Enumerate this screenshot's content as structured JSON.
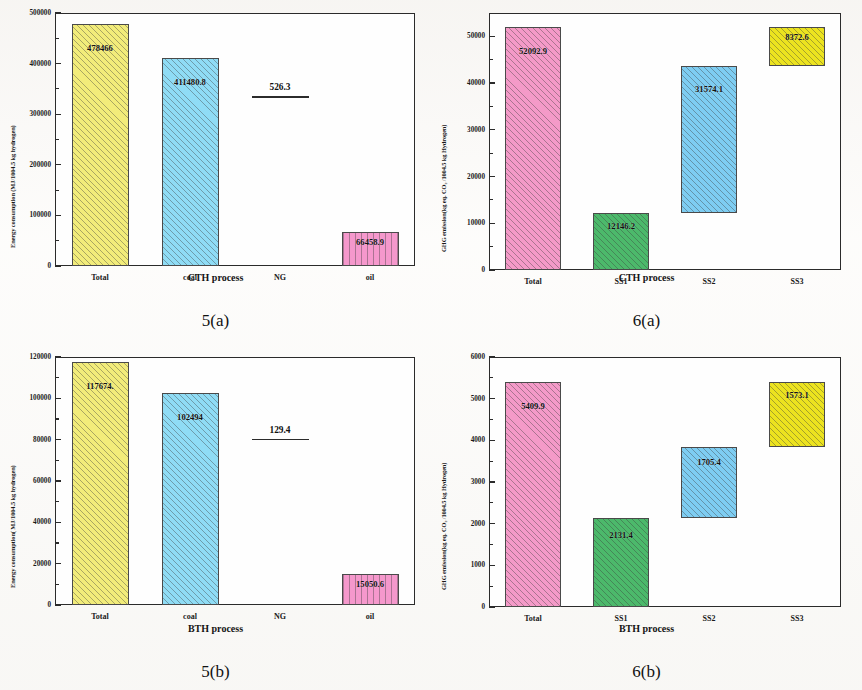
{
  "figure": {
    "panels": [
      "5(a)",
      "5(b)",
      "6(a)",
      "6(b)"
    ]
  },
  "panel_5a": {
    "caption": "5(a)",
    "xlabel": "CTH process",
    "ylabel": "Energy consumption (MJ/1004.5 kg hydrogen)",
    "yticks": [
      "0",
      "100000",
      "200000",
      "300000",
      "400000",
      "500000"
    ],
    "xticks": [
      "Total",
      "coal",
      "NG",
      "oil"
    ],
    "labels": [
      "478466",
      "411480.8",
      "526.3",
      "66458.9"
    ]
  },
  "panel_5b": {
    "caption": "5(b)",
    "xlabel": "BTH process",
    "ylabel": "Energy consumption( MJ/1004.5 kg hydrogen)",
    "yticks": [
      "0",
      "20000",
      "40000",
      "60000",
      "80000",
      "100000",
      "120000"
    ],
    "xticks": [
      "Total",
      "coal",
      "NG",
      "oil"
    ],
    "labels": [
      "117674.",
      "102494",
      "129.4",
      "15050.6"
    ]
  },
  "panel_6a": {
    "caption": "6(a)",
    "xlabel": "CTH process",
    "ylabel": "GHG emission(kg eq. CO₂ /1004.5 kg Hydrogen)",
    "yticks": [
      "0",
      "10000",
      "20000",
      "30000",
      "40000",
      "50000"
    ],
    "xticks": [
      "Total",
      "SS1",
      "SS2",
      "SS3"
    ],
    "labels": [
      "52092.9",
      "12146.2",
      "31574.1",
      "8372.6"
    ]
  },
  "panel_6b": {
    "caption": "6(b)",
    "xlabel": "BTH process",
    "ylabel": "GHG emission(kg eq. CO₂ /1004.5 kg Hydrogen)",
    "yticks": [
      "0",
      "1000",
      "2000",
      "3000",
      "4000",
      "5000",
      "6000"
    ],
    "xticks": [
      "Total",
      "SS1",
      "SS2",
      "SS3"
    ],
    "labels": [
      "5409.9",
      "2131.4",
      "1705.4",
      "1573.1"
    ]
  },
  "chart_data": [
    {
      "type": "bar",
      "title": "5(a)",
      "xlabel": "CTH process",
      "ylabel": "Energy consumption (MJ/1004.5 kg hydrogen)",
      "categories": [
        "Total",
        "coal",
        "NG",
        "oil"
      ],
      "values": [
        478466,
        411480.8,
        526.3,
        66458.9
      ],
      "value_labels": [
        "478466",
        "411480.8",
        "526.3",
        "66458.9"
      ],
      "bar_colors": [
        "#f2ec7a",
        "#8fdcf5",
        "#ffffff",
        "#f598cc"
      ],
      "bar_patterns": [
        "diagonal-hatch",
        "diagonal-hatch",
        "none",
        "vertical-hatch"
      ],
      "ylim": [
        0,
        500000
      ],
      "ytick_values": [
        0,
        100000,
        200000,
        300000,
        400000,
        500000
      ],
      "grid": false,
      "legend": "none",
      "notes": "NG bar is effectively zero height; rendered as a thin horizontal line with its value printed above."
    },
    {
      "type": "bar",
      "title": "5(b)",
      "xlabel": "BTH process",
      "ylabel": "Energy consumption( MJ/1004.5 kg hydrogen)",
      "categories": [
        "Total",
        "coal",
        "NG",
        "oil"
      ],
      "values": [
        117674,
        102494,
        129.4,
        15050.6
      ],
      "value_labels": [
        "117674.",
        "102494",
        "129.4",
        "15050.6"
      ],
      "bar_colors": [
        "#f2ec7a",
        "#8fdcf5",
        "#ffffff",
        "#f598cc"
      ],
      "bar_patterns": [
        "diagonal-hatch",
        "diagonal-hatch",
        "none",
        "vertical-hatch"
      ],
      "ylim": [
        0,
        120000
      ],
      "ytick_values": [
        0,
        20000,
        40000,
        60000,
        80000,
        100000,
        120000
      ],
      "grid": false,
      "legend": "none",
      "notes": "NG bar is effectively zero height; rendered as a thin horizontal line with its value printed above."
    },
    {
      "type": "bar",
      "title": "6(a)",
      "xlabel": "CTH process",
      "ylabel": "GHG emission(kg eq. CO2 /1004.5 kg Hydrogen)",
      "categories": [
        "Total",
        "SS1",
        "SS2",
        "SS3"
      ],
      "values": [
        52092.9,
        12146.2,
        31574.1,
        8372.6
      ],
      "value_labels": [
        "52092.9",
        "12146.2",
        "31574.1",
        "8372.6"
      ],
      "bar_bases": [
        0,
        0,
        12146.2,
        43720.3
      ],
      "bar_tops": [
        52092.9,
        12146.2,
        43720.3,
        52092.9
      ],
      "bar_colors": [
        "#f49ac8",
        "#4cb96b",
        "#7ecdf2",
        "#ece31f"
      ],
      "bar_patterns": [
        "diagonal-hatch",
        "diagonal-hatch",
        "diagonal-hatch",
        "diagonal-hatch"
      ],
      "ylim": [
        0,
        55000
      ],
      "ytick_values": [
        0,
        10000,
        20000,
        30000,
        40000,
        50000
      ],
      "grid": false,
      "legend": "none",
      "notes": "Waterfall style: SS2 and SS3 bars are floating, stacked on the cumulative sum of preceding sub-stages."
    },
    {
      "type": "bar",
      "title": "6(b)",
      "xlabel": "BTH process",
      "ylabel": "GHG emission(kg eq. CO2 /1004.5 kg Hydrogen)",
      "categories": [
        "Total",
        "SS1",
        "SS2",
        "SS3"
      ],
      "values": [
        5409.9,
        2131.4,
        1705.4,
        1573.1
      ],
      "value_labels": [
        "5409.9",
        "2131.4",
        "1705.4",
        "1573.1"
      ],
      "bar_bases": [
        0,
        0,
        2131.4,
        3836.8
      ],
      "bar_tops": [
        5409.9,
        2131.4,
        3836.8,
        5409.9
      ],
      "bar_colors": [
        "#f49ac8",
        "#4cb96b",
        "#7ecdf2",
        "#ece31f"
      ],
      "bar_patterns": [
        "diagonal-hatch",
        "diagonal-hatch",
        "diagonal-hatch",
        "diagonal-hatch"
      ],
      "ylim": [
        0,
        6000
      ],
      "ytick_values": [
        0,
        1000,
        2000,
        3000,
        4000,
        5000,
        6000
      ],
      "grid": false,
      "legend": "none",
      "notes": "Waterfall style: SS2 and SS3 bars are floating, stacked on the cumulative sum of preceding sub-stages."
    }
  ]
}
